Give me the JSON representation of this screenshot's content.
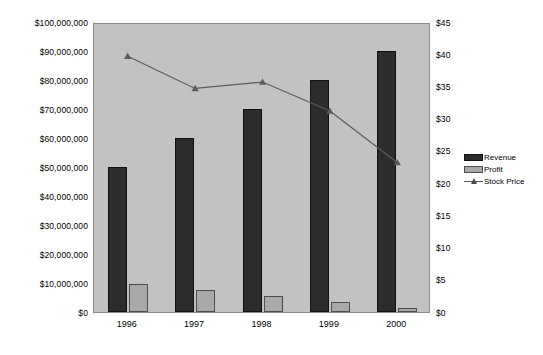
{
  "chart_data": {
    "type": "bar",
    "title": "",
    "subtitle": "",
    "xlabel": "",
    "ylabel": "",
    "categories": [
      "1996",
      "1997",
      "1998",
      "1999",
      "2000"
    ],
    "series": [
      {
        "name": "Revenue",
        "kind": "bar",
        "axis": "left",
        "color": "#2c2c2c",
        "values": [
          50000000,
          60000000,
          70000000,
          80000000,
          90000000
        ]
      },
      {
        "name": "Profit",
        "kind": "bar",
        "axis": "left",
        "color": "#a9a9a9",
        "values": [
          9500000,
          7500000,
          5500000,
          3500000,
          1500000
        ]
      },
      {
        "name": "Stock Price",
        "kind": "line",
        "axis": "right",
        "color": "#5b5b5b",
        "marker": "triangle",
        "values": [
          40,
          35,
          36,
          31.5,
          23.5
        ]
      }
    ],
    "left_axis": {
      "label": "",
      "min": 0,
      "max": 100000000,
      "step": 10000000,
      "ticks": [
        "$0",
        "$10,000,000",
        "$20,000,000",
        "$30,000,000",
        "$40,000,000",
        "$50,000,000",
        "$60,000,000",
        "$70,000,000",
        "$80,000,000",
        "$90,000,000",
        "$100,000,000"
      ]
    },
    "right_axis": {
      "label": "",
      "min": 0,
      "max": 45,
      "step": 5,
      "ticks": [
        "$0",
        "$5",
        "$10",
        "$15",
        "$20",
        "$25",
        "$30",
        "$35",
        "$40",
        "$45"
      ]
    },
    "legend": {
      "position": "right",
      "entries": [
        {
          "label": "Revenue",
          "swatch": "revenue"
        },
        {
          "label": "Profit",
          "swatch": "profit"
        },
        {
          "label": "Stock Price",
          "swatch": "line"
        }
      ]
    },
    "grid": false,
    "plot_background": "#c2c2c2",
    "page_background": "#ffffff"
  }
}
